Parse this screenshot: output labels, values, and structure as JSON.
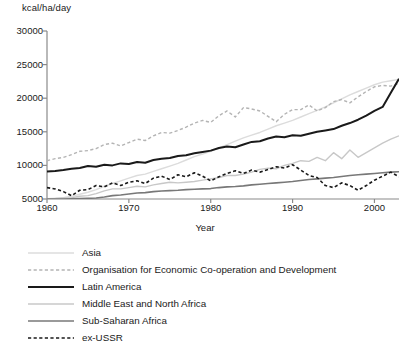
{
  "chart_data": {
    "type": "line",
    "title": "",
    "ylabel": "kcal/ha/day",
    "xlabel": "Year",
    "xlim": [
      1960,
      2003
    ],
    "ylim": [
      5000,
      30000
    ],
    "xticks": [
      "1960",
      "1970",
      "1980",
      "1990",
      "2000"
    ],
    "xtick_values": [
      1960,
      1970,
      1980,
      1990,
      2000
    ],
    "yticks": [
      "5000",
      "10000",
      "15000",
      "20000",
      "25000",
      "30000"
    ],
    "ytick_values": [
      5000,
      10000,
      15000,
      20000,
      25000,
      30000
    ],
    "grid": false,
    "legend_position": "below",
    "x": [
      1960,
      1961,
      1962,
      1963,
      1964,
      1965,
      1966,
      1967,
      1968,
      1969,
      1970,
      1971,
      1972,
      1973,
      1974,
      1975,
      1976,
      1977,
      1978,
      1979,
      1980,
      1981,
      1982,
      1983,
      1984,
      1985,
      1986,
      1987,
      1988,
      1989,
      1990,
      1991,
      1992,
      1993,
      1994,
      1995,
      1996,
      1997,
      1998,
      1999,
      2000,
      2001,
      2002,
      2003
    ],
    "series": [
      {
        "name": "Asia",
        "style": "solid",
        "color": "#dcdcdc",
        "width": 1.4,
        "values": [
          5050,
          5100,
          5200,
          5400,
          5700,
          6000,
          6400,
          6900,
          7300,
          7700,
          8100,
          8500,
          8700,
          9100,
          9500,
          9900,
          10300,
          10800,
          11300,
          11700,
          12100,
          12600,
          13100,
          13600,
          14100,
          14500,
          14900,
          15400,
          15900,
          16300,
          16700,
          17200,
          17700,
          18200,
          18700,
          19300,
          19900,
          20500,
          21000,
          21500,
          22000,
          22400,
          22600,
          22800
        ]
      },
      {
        "name": "Organisation for Economic Co-operation and Development",
        "style": "dashed",
        "color": "#b4b4b4",
        "width": 1.4,
        "values": [
          10700,
          11000,
          11200,
          11600,
          12100,
          12200,
          12500,
          13100,
          13300,
          12900,
          13400,
          13900,
          13700,
          14400,
          14900,
          14800,
          15200,
          15700,
          16300,
          16700,
          16400,
          17400,
          18100,
          17200,
          18600,
          18400,
          18100,
          17300,
          16500,
          17600,
          18300,
          18300,
          19000,
          18100,
          18600,
          19500,
          19800,
          19300,
          20200,
          21000,
          21700,
          21900,
          21800,
          22200
        ]
      },
      {
        "name": "Latin America",
        "style": "solid",
        "color": "#1a1a1a",
        "width": 2.0,
        "values": [
          9100,
          9150,
          9300,
          9500,
          9600,
          9900,
          9800,
          10100,
          10000,
          10300,
          10200,
          10500,
          10400,
          10800,
          11000,
          11100,
          11400,
          11500,
          11800,
          12000,
          12200,
          12600,
          12800,
          12700,
          13100,
          13500,
          13600,
          14000,
          14300,
          14200,
          14500,
          14400,
          14700,
          15000,
          15200,
          15400,
          15900,
          16300,
          16800,
          17400,
          18100,
          18700,
          20800,
          22900
        ]
      },
      {
        "name": "Middle East and North Africa",
        "style": "solid",
        "color": "#c8c8c8",
        "width": 1.4,
        "values": [
          5050,
          5100,
          5150,
          5200,
          5400,
          5500,
          5800,
          6200,
          6500,
          6500,
          6700,
          6900,
          6800,
          7100,
          7300,
          7500,
          7400,
          7500,
          7600,
          7800,
          8000,
          8200,
          8500,
          8500,
          8700,
          9000,
          9400,
          9600,
          9500,
          10000,
          10300,
          10700,
          10600,
          11200,
          10700,
          11900,
          11000,
          12300,
          11200,
          11900,
          12600,
          13300,
          13900,
          14400
        ]
      },
      {
        "name": "Sub-Saharan Africa",
        "style": "solid",
        "color": "#787878",
        "width": 1.6,
        "values": [
          4950,
          4980,
          5000,
          5020,
          5050,
          5100,
          5150,
          5300,
          5500,
          5600,
          5750,
          5900,
          5950,
          6100,
          6200,
          6250,
          6300,
          6400,
          6450,
          6500,
          6550,
          6700,
          6800,
          6850,
          6950,
          7100,
          7200,
          7300,
          7400,
          7500,
          7600,
          7750,
          7900,
          8000,
          8100,
          8200,
          8350,
          8500,
          8600,
          8700,
          8800,
          8900,
          9000,
          9050
        ]
      },
      {
        "name": "ex-USSR",
        "style": "dashed",
        "color": "#1a1a1a",
        "width": 1.6,
        "values": [
          6700,
          6500,
          6100,
          5500,
          6300,
          6400,
          7000,
          6800,
          7400,
          7000,
          7500,
          7700,
          7300,
          8100,
          8400,
          7900,
          8600,
          8300,
          8900,
          8400,
          7700,
          8300,
          8800,
          9200,
          8800,
          9300,
          9000,
          9400,
          9800,
          9600,
          10100,
          9300,
          8500,
          8200,
          7000,
          6700,
          7400,
          7000,
          6300,
          7000,
          7800,
          8400,
          9000,
          8300
        ]
      }
    ]
  },
  "legend": {
    "items": [
      {
        "label": "Asia"
      },
      {
        "label": "Organisation for Economic Co-operation and Development"
      },
      {
        "label": "Latin America"
      },
      {
        "label": "Middle East and North Africa"
      },
      {
        "label": "Sub-Saharan Africa"
      },
      {
        "label": "ex-USSR"
      }
    ]
  },
  "axes": {
    "y_title": "kcal/ha/day",
    "x_title": "Year"
  }
}
